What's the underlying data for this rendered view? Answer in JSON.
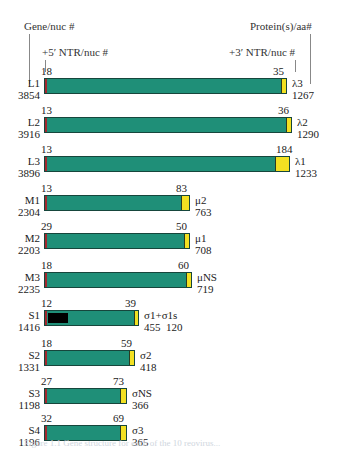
{
  "headers": {
    "gene_nuc": "Gene/nuc #",
    "ntr5": "+5′ NTR/nuc #",
    "ntr3": "+3′ NTR/nuc #",
    "protein": "Protein(s)/aa#"
  },
  "colors": {
    "coding": "#1f8f78",
    "ntr5": "#a0282e",
    "ntr3": "#f2e022",
    "s1_overlap": "#000000"
  },
  "genes": [
    {
      "gene": "L1",
      "nuc": "3854",
      "ntr5": "18",
      "ntr3": "35",
      "protein": "λ3",
      "aa": "1267",
      "width": 243,
      "ntr3_w": 4
    },
    {
      "gene": "L2",
      "nuc": "3916",
      "ntr5": "13",
      "ntr3": "36",
      "protein": "λ2",
      "aa": "1290",
      "width": 248,
      "ntr3_w": 4
    },
    {
      "gene": "L3",
      "nuc": "3896",
      "ntr5": "13",
      "ntr3": "184",
      "protein": "λ1",
      "aa": "1233",
      "width": 246,
      "ntr3_w": 13
    },
    {
      "gene": "M1",
      "nuc": "2304",
      "ntr5": "13",
      "ntr3": "83",
      "protein": "μ2",
      "aa": "763",
      "width": 146,
      "ntr3_w": 7
    },
    {
      "gene": "M2",
      "nuc": "2203",
      "ntr5": "29",
      "ntr3": "50",
      "protein": "μ1",
      "aa": "708",
      "width": 146,
      "ntr3_w": 4
    },
    {
      "gene": "M3",
      "nuc": "2235",
      "ntr5": "18",
      "ntr3": "60",
      "protein": "μNS",
      "aa": "719",
      "width": 148,
      "ntr3_w": 4
    },
    {
      "gene": "S1",
      "nuc": "1416",
      "ntr5": "12",
      "ntr3": "39",
      "protein": "σ1+σ1s",
      "aa": "455  120",
      "width": 95,
      "ntr3_w": 3
    },
    {
      "gene": "S2",
      "nuc": "1331",
      "ntr5": "18",
      "ntr3": "59",
      "protein": "σ2",
      "aa": "418",
      "width": 91,
      "ntr3_w": 4
    },
    {
      "gene": "S3",
      "nuc": "1198",
      "ntr5": "27",
      "ntr3": "73",
      "protein": "σNS",
      "aa": "366",
      "width": 83,
      "ntr3_w": 5
    },
    {
      "gene": "S4",
      "nuc": "1196",
      "ntr5": "32",
      "ntr3": "69",
      "protein": "σ3",
      "aa": "365",
      "width": 83,
      "ntr3_w": 5
    }
  ],
  "caption": "Figure 1.1  Gene structure for each of the 10 reovirus..."
}
